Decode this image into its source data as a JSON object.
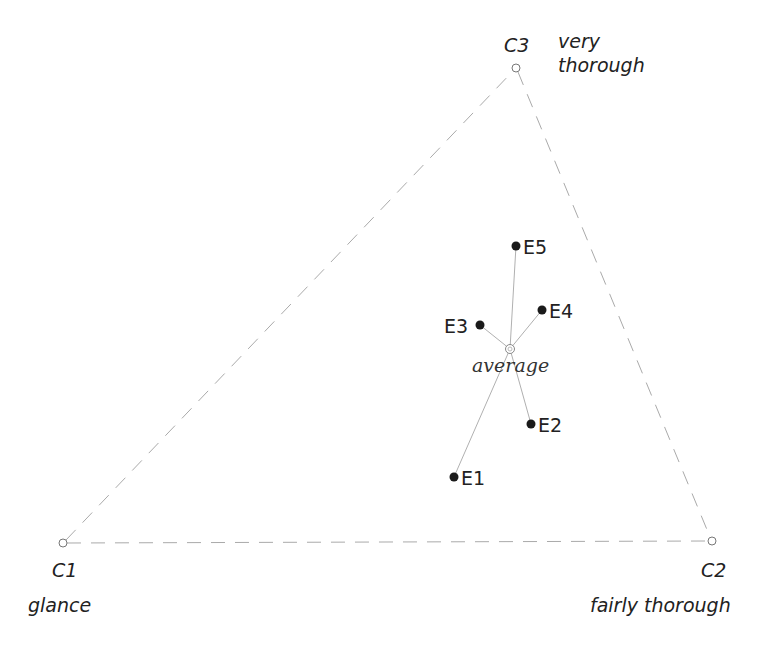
{
  "diagram": {
    "type": "ternary-plot",
    "corners": [
      {
        "id": "C1",
        "label": "C1",
        "description": "glance",
        "x": 63,
        "y": 543
      },
      {
        "id": "C2",
        "label": "C2",
        "description": "fairly thorough",
        "x": 712,
        "y": 541
      },
      {
        "id": "C3",
        "label": "C3",
        "description_line1": "very",
        "description_line2": "thorough",
        "x": 516,
        "y": 68
      }
    ],
    "average": {
      "label": "average",
      "x": 510,
      "y": 349
    },
    "experts": [
      {
        "label": "E1",
        "x": 454,
        "y": 477
      },
      {
        "label": "E2",
        "x": 531,
        "y": 424
      },
      {
        "label": "E3",
        "x": 480,
        "y": 325
      },
      {
        "label": "E4",
        "x": 542,
        "y": 310
      },
      {
        "label": "E5",
        "x": 516,
        "y": 246
      }
    ],
    "colors": {
      "edge": "#aaaaaa",
      "spoke": "#b0b0b0",
      "point": "#1a1a1a",
      "text": "#222222"
    }
  }
}
